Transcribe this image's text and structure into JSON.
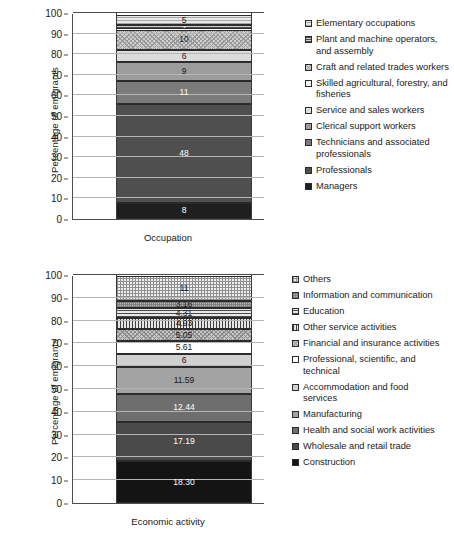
{
  "chart_data": [
    {
      "type": "bar",
      "id": "occupation",
      "title": "",
      "xlabel": "Occupation",
      "ylabel": "Percentage of emigrants",
      "ylim": [
        0,
        100
      ],
      "yticks": [
        0,
        10,
        20,
        30,
        40,
        50,
        60,
        70,
        80,
        90,
        100
      ],
      "grid": true,
      "stacked": true,
      "legend_position": "right",
      "categories": [
        "Occupation"
      ],
      "segments_bottom_to_top": [
        {
          "name": "Managers",
          "value": 8,
          "label": "8",
          "fill": "p-o9",
          "label_color": "light"
        },
        {
          "name": "Professionals",
          "value": 48,
          "label": "48",
          "fill": "p-o8",
          "label_color": "light"
        },
        {
          "name": "Technicians and associated professionals",
          "value": 11,
          "label": "11",
          "fill": "p-o7",
          "label_color": "light"
        },
        {
          "name": "Clerical support workers",
          "value": 9,
          "label": "9",
          "fill": "p-o6",
          "label_color": "dark"
        },
        {
          "name": "Service and sales workers",
          "value": 6,
          "label": "6",
          "fill": "p-o5",
          "label_color": "dark"
        },
        {
          "name": "Skilled agricultural, forestry, and fisheries",
          "value": 0,
          "label": "0",
          "fill": "p-o4",
          "label_color": "dark"
        },
        {
          "name": "Craft and related trades workers",
          "value": 10,
          "label": "10",
          "fill": "p-o3",
          "label_color": "dark"
        },
        {
          "name": "Plant and machine operators, and assembly",
          "value": 2,
          "label": "2",
          "fill": "p-o2",
          "label_color": "light"
        },
        {
          "name": "Elementary occupations",
          "value": 5,
          "label": "5",
          "fill": "p-o1",
          "label_color": "dark"
        }
      ],
      "legend": [
        {
          "label": "Elementary occupations",
          "fill": "p-o1"
        },
        {
          "label": "Plant and machine operators, and assembly",
          "fill": "p-o2"
        },
        {
          "label": "Craft and related trades workers",
          "fill": "p-o3"
        },
        {
          "label": "Skilled agricultural, forestry, and fisheries",
          "fill": "p-o4"
        },
        {
          "label": "Service and sales workers",
          "fill": "p-o5"
        },
        {
          "label": "Clerical support workers",
          "fill": "p-o6"
        },
        {
          "label": "Technicians and associated professionals",
          "fill": "p-o7"
        },
        {
          "label": "Professionals",
          "fill": "p-o8"
        },
        {
          "label": "Managers",
          "fill": "p-o9"
        }
      ]
    },
    {
      "type": "bar",
      "id": "economic-activity",
      "title": "",
      "xlabel": "Economic activity",
      "ylabel": "Percentage of emigrants",
      "ylim": [
        0,
        100
      ],
      "yticks": [
        0,
        10,
        20,
        30,
        40,
        50,
        60,
        70,
        80,
        90,
        100
      ],
      "grid": true,
      "stacked": true,
      "legend_position": "right",
      "categories": [
        "Economic activity"
      ],
      "segments_bottom_to_top": [
        {
          "name": "Construction",
          "value": 18.3,
          "label": "18.30",
          "fill": "p-e11",
          "label_color": "light"
        },
        {
          "name": "Wholesale and retail trade",
          "value": 17.19,
          "label": "17.19",
          "fill": "p-e10",
          "label_color": "light"
        },
        {
          "name": "Health and social work activities",
          "value": 12.44,
          "label": "12.44",
          "fill": "p-e9",
          "label_color": "light"
        },
        {
          "name": "Manufacturing",
          "value": 11.59,
          "label": "11.59",
          "fill": "p-e8",
          "label_color": "dark"
        },
        {
          "name": "Accommodation and food services",
          "value": 6,
          "label": "6",
          "fill": "p-e7",
          "label_color": "dark"
        },
        {
          "name": "Professional, scientific, and technical",
          "value": 5.61,
          "label": "5.61",
          "fill": "p-e6",
          "label_color": "dark"
        },
        {
          "name": "Financial and insurance activities",
          "value": 5.05,
          "label": "5.05",
          "fill": "p-e5",
          "label_color": "dark"
        },
        {
          "name": "Other service activities",
          "value": 4.93,
          "label": "4.93",
          "fill": "p-e4",
          "label_color": "dark"
        },
        {
          "name": "Education",
          "value": 4.31,
          "label": "4.31",
          "fill": "p-e3",
          "label_color": "dark"
        },
        {
          "name": "Information and communication",
          "value": 3.16,
          "label": "3.16",
          "fill": "p-e2",
          "label_color": "dark"
        },
        {
          "name": "Others",
          "value": 11,
          "label": "11",
          "fill": "p-e1",
          "label_color": "dark"
        }
      ],
      "legend": [
        {
          "label": "Others",
          "fill": "p-e1"
        },
        {
          "label": "Information and communication",
          "fill": "p-e2"
        },
        {
          "label": "Education",
          "fill": "p-e3"
        },
        {
          "label": "Other service activities",
          "fill": "p-e4"
        },
        {
          "label": "Financial and insurance activities",
          "fill": "p-e5"
        },
        {
          "label": "Professional, scientific, and technical",
          "fill": "p-e6"
        },
        {
          "label": "Accommodation and food services",
          "fill": "p-e7"
        },
        {
          "label": "Manufacturing",
          "fill": "p-e8"
        },
        {
          "label": "Health and social work activities",
          "fill": "p-e9"
        },
        {
          "label": "Wholesale and retail trade",
          "fill": "p-e10"
        },
        {
          "label": "Construction",
          "fill": "p-e11"
        }
      ]
    }
  ]
}
